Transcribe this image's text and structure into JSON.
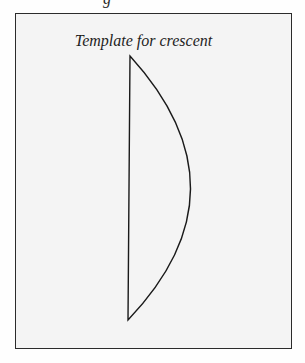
{
  "figure": {
    "top_fragment": "g",
    "title": "Template for crescent",
    "shape": {
      "name": "crescent",
      "top_point": [
        130,
        56
      ],
      "bottom_point": [
        128,
        320
      ],
      "arc_apex": [
        189,
        195
      ],
      "stroke_color": "#1a1a1a"
    },
    "colors": {
      "background": "#fefefe",
      "box_fill": "#f4f4f4",
      "border": "#2b2b2b"
    }
  }
}
